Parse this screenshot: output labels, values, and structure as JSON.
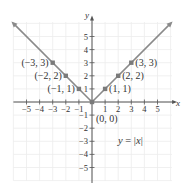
{
  "chart_data": {
    "type": "line",
    "title": "",
    "xlabel": "x",
    "ylabel": "y",
    "xlim": [
      -6,
      6
    ],
    "ylim": [
      -6,
      6
    ],
    "grid": true,
    "x_ticks": [
      -5,
      -4,
      -3,
      -2,
      -1,
      1,
      2,
      3,
      4,
      5
    ],
    "y_ticks": [
      5,
      4,
      3,
      2,
      1,
      -1,
      -2,
      -3,
      -4,
      -5
    ],
    "x_tick_labels": [
      "−5",
      "−4",
      "−3",
      "−2",
      "−1",
      "1",
      "2",
      "3",
      "4",
      "5"
    ],
    "y_tick_labels": [
      "5",
      "4",
      "3",
      "2",
      "1",
      "−1",
      "−2",
      "−3",
      "−4",
      "−5"
    ],
    "series": [
      {
        "name": "y = |x|",
        "x": [
          -6,
          -3,
          -2,
          -1,
          0,
          1,
          2,
          3,
          6
        ],
        "y": [
          6,
          3,
          2,
          1,
          0,
          1,
          2,
          3,
          6
        ],
        "color": "#8a8a8a"
      }
    ],
    "points": [
      {
        "x": -3,
        "y": 3,
        "label": "(−3, 3)"
      },
      {
        "x": -2,
        "y": 2,
        "label": "(−2, 2)"
      },
      {
        "x": -1,
        "y": 1,
        "label": "(−1, 1)"
      },
      {
        "x": 0,
        "y": 0,
        "label": "(0, 0)"
      },
      {
        "x": 1,
        "y": 1,
        "label": "(1, 1)"
      },
      {
        "x": 2,
        "y": 2,
        "label": "(2, 2)"
      },
      {
        "x": 3,
        "y": 3,
        "label": "(3, 3)"
      }
    ],
    "annotations": [
      {
        "text": "y = |x|",
        "x": 2.5,
        "y": -3
      }
    ],
    "legend": "none"
  },
  "labels": {
    "x_axis": "x",
    "y_axis": "y",
    "equation": "y = |x|"
  },
  "colors": {
    "line": "#8a8a8a",
    "points": "#7a7a7a",
    "axis": "#555555",
    "grid": "#ececec"
  }
}
